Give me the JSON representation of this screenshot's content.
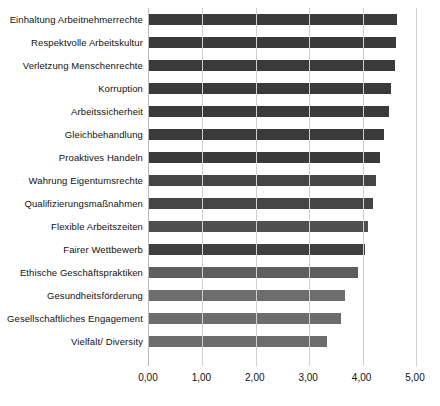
{
  "chart_data": {
    "type": "bar",
    "orientation": "horizontal",
    "title": "",
    "subtitle": "",
    "xlabel": "",
    "ylabel": "",
    "xlim": [
      0,
      5
    ],
    "grid": true,
    "legend": "none",
    "decimal_separator": ",",
    "xticks": [
      "0,00",
      "1,00",
      "2,00",
      "3,00",
      "4,00",
      "5,00"
    ],
    "xtick_values": [
      0,
      1,
      2,
      3,
      4,
      5
    ],
    "categories": [
      "Einhaltung Arbeitnehmerrechte",
      "Respektvolle Arbeitskultur",
      "Verletzung Menschenrechte",
      "Korruption",
      "Arbeitssicherheit",
      "Gleichbehandlung",
      "Proaktives Handeln",
      "Wahrung Eigentumsrechte",
      "Qualifizierungsmaßnahmen",
      "Flexible Arbeitszeiten",
      "Fairer Wettbewerb",
      "Ethische Geschäftspraktiken",
      "Gesundheitsförderung",
      "Gesellschaftliches Engagement",
      "Vielfalt/ Diversity"
    ],
    "values": [
      4.64,
      4.63,
      4.61,
      4.53,
      4.49,
      4.41,
      4.33,
      4.26,
      4.19,
      4.1,
      4.05,
      3.92,
      3.67,
      3.6,
      3.33
    ],
    "bar_colors": [
      "#3a3a3a",
      "#3a3a3a",
      "#3a3a3a",
      "#3a3a3a",
      "#3a3a3a",
      "#3a3a3a",
      "#3a3a3a",
      "#454545",
      "#454545",
      "#4f4f4f",
      "#3f3f3f",
      "#5e5e5e",
      "#6d6d6d",
      "#6d6d6d",
      "#6d6d6d"
    ],
    "grid_color": "#cfcfcf",
    "axis_color": "#b9b9b9",
    "background": "#ffffff"
  }
}
